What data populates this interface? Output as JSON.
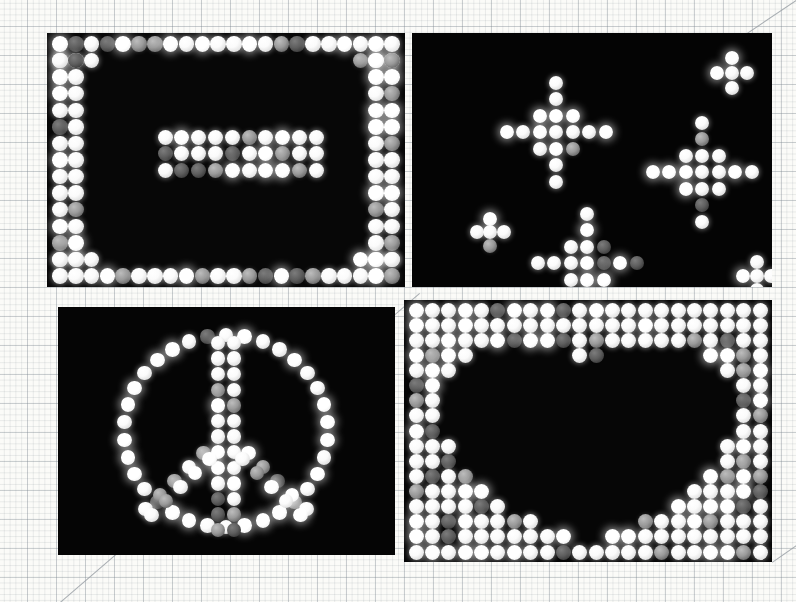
{
  "image": {
    "title": "Lite-Brite peg board photo collage",
    "medium": "four photographs arranged on graph paper",
    "background": {
      "name": "graph paper",
      "grid_minor_px": 5.8,
      "grid_major_px": 29,
      "paper_color": "#fbfbf8",
      "grid_color": "#78828c"
    },
    "pencil_lines": [
      {
        "name": "top-right-diagonal",
        "x1": 796,
        "y1": 0,
        "x2": 665,
        "y2": 88
      },
      {
        "name": "bottom-left-diagonal",
        "x1": 60,
        "y1": 602,
        "x2": 420,
        "y2": 292
      },
      {
        "name": "bottom-right-diagonal",
        "x1": 772,
        "y1": 562,
        "x2": 796,
        "y2": 545
      }
    ]
  },
  "panels": [
    {
      "id": "panel-rectangle",
      "label": "Rectangle border with inner bar",
      "position": "top-left",
      "rect": {
        "x": 47,
        "y": 33,
        "w": 358,
        "h": 254
      },
      "background": "#070707",
      "peg_color": "#ffffff",
      "design": "rectangular outline of white pegs with a solid 3x10 block centered",
      "peg_count": 124
    },
    {
      "id": "panel-crosses",
      "label": "Four plus/cross shapes",
      "position": "top-right",
      "rect": {
        "x": 412,
        "y": 33,
        "w": 360,
        "h": 254
      },
      "background": "#040404",
      "peg_color": "#ffffff",
      "design": "two large diamond-crosses and three small four-peg clusters",
      "peg_count": 68
    },
    {
      "id": "panel-peace",
      "label": "Peace sign",
      "position": "bottom-left",
      "rect": {
        "x": 58,
        "y": 307,
        "w": 337,
        "h": 248
      },
      "background": "#050505",
      "peg_color": "#ffffff",
      "design": "circle outline with vertical stem and two diagonal arms",
      "peg_count": 96
    },
    {
      "id": "panel-heart",
      "label": "Heart in negative space",
      "position": "bottom-right",
      "rect": {
        "x": 404,
        "y": 300,
        "w": 368,
        "h": 262
      },
      "background": "#060606",
      "peg_color": "#e8e8e8",
      "design": "full grid of white pegs with a heart-shaped void of unlit holes",
      "peg_count": 392
    }
  ]
}
